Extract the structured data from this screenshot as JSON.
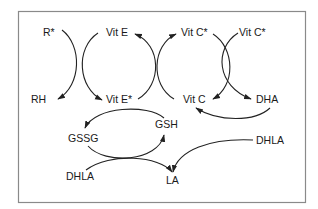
{
  "diagram": {
    "title": "",
    "colors": {
      "line": "#222222",
      "frame": "#8a8a8a",
      "text": "#1a1a1a",
      "background": "#ffffff"
    },
    "nodes": {
      "r_radical": "R*",
      "rh": "RH",
      "vit_e": "Vit E",
      "vit_e_radical": "Vit E*",
      "vit_c_radical_left": "Vit C*",
      "vit_c_radical_right": "Vit C*",
      "vit_c": "Vit C",
      "dha": "DHA",
      "gssg": "GSSG",
      "gsh": "GSH",
      "dhla_left": "DHLA",
      "dhla_right": "DHLA",
      "la": "LA"
    },
    "edges": [
      {
        "from": "R*",
        "to": "RH"
      },
      {
        "from": "Vit E",
        "to": "Vit E*"
      },
      {
        "from": "Vit E*",
        "to": "Vit E"
      },
      {
        "from": "Vit C",
        "to": "Vit C*"
      },
      {
        "from": "Vit C*",
        "to": "Vit C"
      },
      {
        "from": "Vit C*",
        "to": "DHA"
      },
      {
        "from": "DHA",
        "to": "Vit C"
      },
      {
        "from": "GSH",
        "to": "GSSG"
      },
      {
        "from": "GSSG",
        "to": "GSH"
      },
      {
        "from": "DHLA",
        "to": "LA"
      },
      {
        "from": "DHLA",
        "to": "LA"
      }
    ]
  }
}
